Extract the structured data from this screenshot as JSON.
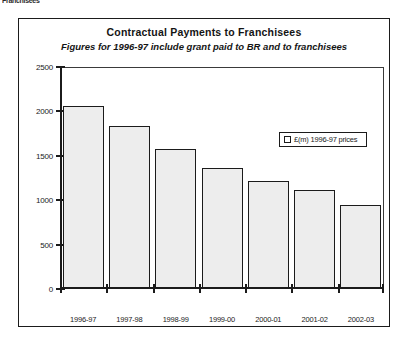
{
  "scan_artifact": {
    "text": "Franchisees"
  },
  "chart_data": {
    "type": "bar",
    "title": "Contractual Payments to Franchisees",
    "subtitle": "Figures for 1996-97 include grant paid to BR and to franchisees",
    "categories": [
      "1996-97",
      "1997-98",
      "1998-99",
      "1999-00",
      "2000-01",
      "2001-02",
      "2002-03"
    ],
    "values": [
      2050,
      1830,
      1570,
      1350,
      1200,
      1100,
      930
    ],
    "series": [
      {
        "name": "£(m) 1996-97 prices",
        "values": [
          2050,
          1830,
          1570,
          1350,
          1200,
          1100,
          930
        ]
      }
    ],
    "xlabel": "",
    "ylabel": "",
    "ylim": [
      0,
      2500
    ],
    "yticks": [
      0,
      500,
      1000,
      1500,
      2000,
      2500
    ],
    "ytick_labels": [
      "0",
      "500",
      "1000",
      "1500",
      "2000",
      "2500"
    ],
    "grid": false,
    "legend": {
      "position": "inside-right",
      "entries": [
        "£(m) 1996-97 prices"
      ]
    },
    "colors": {
      "bar_fill": "#ededed",
      "bar_border": "#1b1b1b",
      "axis": "#1b1b1b",
      "text": "#141414",
      "background": "#ffffff"
    }
  }
}
